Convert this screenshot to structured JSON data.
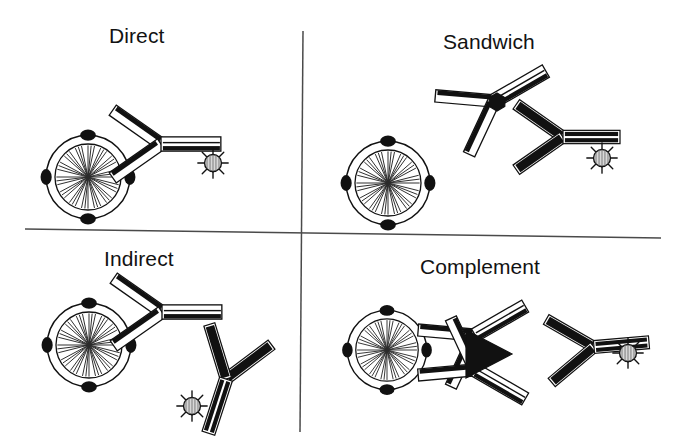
{
  "figure": {
    "kind": "scientific-line-diagram",
    "background_color": "#ffffff",
    "ink_color": "#111111",
    "divider_color": "#555555",
    "layout": "2x2 quadrant grid separated by one vertical and one horizontal rule",
    "panel_count": 4
  },
  "panels": [
    {
      "id": "direct",
      "title": "Direct",
      "quadrant": "top-left",
      "description": "A fluorophore-labelled primary antibody binds directly to an antigen on the cell surface.",
      "elements": [
        "target-cell",
        "primary-antibody",
        "fluorophore-label"
      ]
    },
    {
      "id": "sandwich",
      "title": "Sandwich",
      "quadrant": "top-right",
      "description": "A capture antibody on the cell binds a soluble antigen, which is then bound by a labelled detection antibody.",
      "elements": [
        "target-cell",
        "capture-antibody",
        "antigen-hexagon",
        "detection-antibody",
        "fluorophore-label"
      ]
    },
    {
      "id": "indirect",
      "title": "Indirect",
      "quadrant": "bottom-left",
      "description": "An unlabelled primary antibody binds the cell antigen and is detected by a labelled secondary antibody.",
      "elements": [
        "target-cell",
        "primary-antibody",
        "secondary-antibody",
        "fluorophore-label"
      ]
    },
    {
      "id": "complement",
      "title": "Complement",
      "quadrant": "bottom-right",
      "description": "Two primary antibodies bound to the cell fix a complement component, which is detected by a labelled anti-complement antibody.",
      "elements": [
        "target-cell",
        "primary-antibody-upper",
        "primary-antibody-lower",
        "complement-triangle",
        "anti-complement-antibody",
        "fluorophore-label"
      ]
    }
  ],
  "glyph_legend": [
    {
      "name": "target-cell",
      "appearance": "open circle with radiating spoke hatching inside and small solid knobs (surface antigens) on the rim"
    },
    {
      "name": "antibody",
      "appearance": "Y-shaped ribbon; hollow white band with a heavy black edge stripe"
    },
    {
      "name": "antibody-solid",
      "appearance": "Y-shaped ribbon drawn in solid black"
    },
    {
      "name": "fluorophore-label",
      "appearance": "small hatched disc with short radiating rays, like a sun burst"
    },
    {
      "name": "antigen-hexagon",
      "appearance": "small solid black hexagon"
    },
    {
      "name": "complement-triangle",
      "appearance": "solid black triangle pointing right"
    }
  ]
}
